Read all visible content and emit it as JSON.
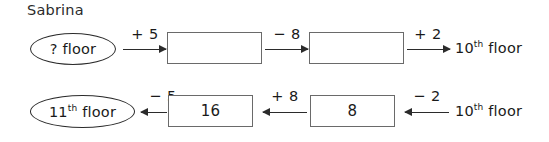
{
  "worksheet": {
    "student_name": "Sabrina",
    "rows": [
      {
        "id": "row-top",
        "start_node": {
          "shape": "oval",
          "text": "? floor"
        },
        "steps": [
          {
            "operation": "+ 5",
            "direction": "right",
            "result": {
              "shape": "box",
              "text": ""
            }
          },
          {
            "operation": "− 8",
            "direction": "right",
            "result": {
              "shape": "box",
              "text": ""
            }
          },
          {
            "operation": "+ 2",
            "direction": "right",
            "result": {
              "shape": "plain",
              "text": "10",
              "ordinal": "th",
              "suffix": " floor"
            }
          }
        ]
      },
      {
        "id": "row-bottom",
        "start_node": {
          "shape": "plain",
          "text": "10",
          "ordinal": "th",
          "suffix": " floor"
        },
        "steps": [
          {
            "operation": "− 2",
            "direction": "left",
            "result": {
              "shape": "box",
              "text": "8"
            }
          },
          {
            "operation": "+ 8",
            "direction": "left",
            "result": {
              "shape": "box",
              "text": "16"
            }
          },
          {
            "operation": "− 5",
            "direction": "left",
            "result": {
              "shape": "oval",
              "text": "11",
              "ordinal": "th",
              "suffix": " floor"
            }
          }
        ]
      }
    ]
  },
  "colors": {
    "background": "#ffffff",
    "ink": "#1a1a1a",
    "oval_stroke": "#2b2b2b",
    "box_stroke": "#6a6a6a",
    "arrow": "#2b2b2b"
  }
}
